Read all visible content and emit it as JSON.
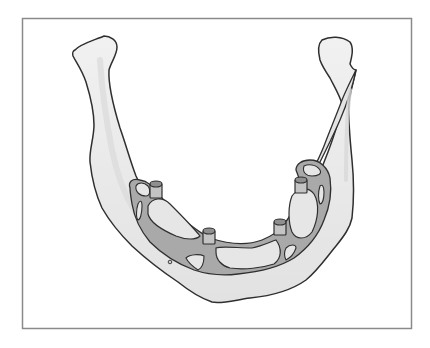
{
  "figure": {
    "frame": {
      "x": 22,
      "y": 18,
      "width": 389,
      "height": 310,
      "stroke": "#8a8a8a"
    },
    "colors": {
      "bone_fill": "#ececec",
      "bone_shadow": "#dcdcdc",
      "outline": "#2f2f2f",
      "framework_fill": "#a9a9a9",
      "framework_hole_fill": "#e6e6e6",
      "post_fill": "#c4c4c4",
      "background": "#ffffff"
    },
    "implant_posts": [
      {
        "name": "left-molar-post",
        "x": 156,
        "y": 190
      },
      {
        "name": "anterior-left-post",
        "x": 209,
        "y": 237
      },
      {
        "name": "anterior-right-post",
        "x": 280,
        "y": 228
      },
      {
        "name": "right-molar-post",
        "x": 301,
        "y": 186
      }
    ],
    "mental_foramen": {
      "x": 170,
      "y": 262
    }
  }
}
